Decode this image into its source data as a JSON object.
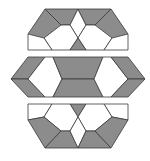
{
  "diagram": {
    "title": "",
    "colors": {
      "shaded": "#8c8c8c",
      "white": "#ffffff",
      "stroke": "#3a3a3a"
    },
    "strips": [
      {
        "name": "top-strip",
        "tiles": [
          {
            "name": "top-left-rhombus",
            "fill": "shaded",
            "points": "45,9 28,34 44,50 61,25"
          },
          {
            "name": "top-left-upper-rhombus",
            "fill": "shaded",
            "points": "45,9 78,9 70,25 61,25"
          },
          {
            "name": "top-center-diamond",
            "fill": "white",
            "points": "70,25 78,9 86,25 78,38"
          },
          {
            "name": "top-right-upper-rhombus",
            "fill": "shaded",
            "points": "78,9 111,9 95,25 86,25"
          },
          {
            "name": "top-right-rhombus",
            "fill": "shaded",
            "points": "111,9 128,34 112,50 95,25"
          },
          {
            "name": "top-left-hexagon",
            "fill": "white",
            "points": "61,25 70,25 78,38 70,50 52,50 44,38"
          },
          {
            "name": "top-right-hexagon",
            "fill": "white",
            "points": "86,25 95,25 112,38 104,50 86,50 78,38"
          },
          {
            "name": "top-left-edge-tri",
            "fill": "white",
            "points": "28,34 44,38 52,50 28,50"
          },
          {
            "name": "top-center-tri",
            "fill": "shaded",
            "points": "78,38 86,50 70,50"
          },
          {
            "name": "top-right-edge-tri",
            "fill": "white",
            "points": "112,38 128,34 128,50 104,50"
          }
        ]
      },
      {
        "name": "middle-strip",
        "tiles": [
          {
            "name": "mid-left-upper-rhombus",
            "fill": "shaded",
            "points": "28,57 11,79 28,79 45,57"
          },
          {
            "name": "mid-left-lower-rhombus",
            "fill": "shaded",
            "points": "11,79 28,97 45,97 28,79"
          },
          {
            "name": "mid-left-hexagon",
            "fill": "white",
            "points": "45,57 53,57 62,79 53,97 45,97 28,79"
          },
          {
            "name": "mid-center-upper-trapezoid",
            "fill": "shaded",
            "points": "53,57 103,57 94,79 62,79"
          },
          {
            "name": "mid-center-lower-trapezoid",
            "fill": "shaded",
            "points": "62,79 94,79 103,97 53,97"
          },
          {
            "name": "mid-right-hexagon",
            "fill": "white",
            "points": "103,57 111,57 128,79 111,97 103,97 94,79"
          },
          {
            "name": "mid-right-upper-rhombus",
            "fill": "shaded",
            "points": "111,57 128,57 145,79 128,79"
          },
          {
            "name": "mid-right-lower-rhombus",
            "fill": "shaded",
            "points": "128,79 145,79 128,97 111,97"
          }
        ]
      },
      {
        "name": "bottom-strip",
        "tiles": [
          {
            "name": "bot-left-edge-tri",
            "fill": "white",
            "points": "28,104 52,104 44,117 28,120"
          },
          {
            "name": "bot-center-tri",
            "fill": "shaded",
            "points": "70,104 86,104 78,117"
          },
          {
            "name": "bot-right-edge-tri",
            "fill": "white",
            "points": "104,104 128,104 128,120 112,117"
          },
          {
            "name": "bot-left-hexagon",
            "fill": "white",
            "points": "52,104 70,104 78,117 70,131 61,131 44,117"
          },
          {
            "name": "bot-right-hexagon",
            "fill": "white",
            "points": "86,104 104,104 112,117 95,131 86,131 78,117"
          },
          {
            "name": "bot-left-rhombus",
            "fill": "shaded",
            "points": "28,120 44,117 61,131 45,148"
          },
          {
            "name": "bot-left-lower-rhombus",
            "fill": "shaded",
            "points": "45,148 61,131 70,131 78,148"
          },
          {
            "name": "bot-center-diamond",
            "fill": "white",
            "points": "78,117 86,131 78,148 70,131"
          },
          {
            "name": "bot-right-lower-rhombus",
            "fill": "shaded",
            "points": "78,148 86,131 95,131 111,148"
          },
          {
            "name": "bot-right-rhombus",
            "fill": "shaded",
            "points": "95,131 112,117 128,120 111,148"
          }
        ]
      }
    ]
  }
}
